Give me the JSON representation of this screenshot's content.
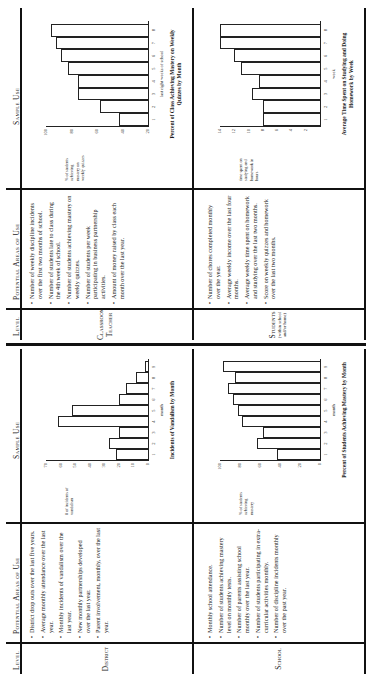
{
  "left_table": {
    "headers": {
      "level": "Level",
      "areas": "Potential Areas of Use",
      "sample": "Sample Use"
    },
    "rows": [
      {
        "level": "District",
        "areas": [
          "District drop outs over the last five years.",
          "Average monthly attendance over the last year.",
          "Monthly incidents of vandalism over the last year.",
          "New monthly partnerships developed over the last year.",
          "Parent involvement, monthly, over the last year."
        ]
      },
      {
        "level": "School",
        "areas": [
          "Monthly school attendance.",
          "Number of students achieving mastery level on monthly tests.",
          "Number of parents assisting school monthly over the last year.",
          "Number of students participating in extra-curricular activities monthly.",
          "Number of discipline incidents monthly over the past year."
        ]
      }
    ]
  },
  "right_table": {
    "headers": {
      "level": "Level",
      "areas": "Potential Areas of Use",
      "sample": "Sample Use"
    },
    "rows": [
      {
        "level": "Classroom Teacher",
        "areas": [
          "Number of weekly discipline incidents over the first two months of school.",
          "Number of students late to class during the 4th week of school.",
          "Number of students achieving mastery on weekly quizzes.",
          "Number of students per week participating in business partnership activities.",
          "Amount of money raised by class each month over the last year."
        ]
      },
      {
        "level": "Students",
        "level_note": "(within school and/or home)",
        "areas": [
          "Number of chores completed monthly over the year.",
          "Average weekly income over the last four months.",
          "Average weekly time spent on homework and studying over the last two months.",
          "Score on weekly quizzes and homework over the last two months."
        ]
      }
    ]
  },
  "chart_data": [
    {
      "type": "bar",
      "title": "Incidents of Vandalism by Month",
      "xlabel": "month",
      "ylabel": "# of incidents of vandalism",
      "categories": [
        "1",
        "2",
        "3",
        "4",
        "5",
        "6",
        "7",
        "8",
        "9"
      ],
      "values": [
        22,
        27,
        20,
        62,
        52,
        20,
        15,
        8,
        2
      ],
      "yticks": [
        "0",
        "10",
        "20",
        "30",
        "40",
        "50",
        "60",
        "70"
      ],
      "ylim": [
        0,
        70
      ]
    },
    {
      "type": "bar",
      "title": "Percent of Students Achieving Mastery by Month",
      "xlabel": "month",
      "ylabel": "% of students achieving mastery",
      "categories": [
        "1",
        "2",
        "3",
        "4",
        "5",
        "6",
        "7",
        "8",
        "9"
      ],
      "values": [
        43,
        63,
        57,
        78,
        82,
        87,
        92,
        85,
        97
      ],
      "yticks": [
        "0",
        "20",
        "40",
        "60",
        "80",
        "100"
      ],
      "ylim": [
        0,
        100
      ]
    },
    {
      "type": "bar",
      "title": "Percent of Class Achieving Mastery on Weekly Quizzes by Month",
      "xlabel": "last eight weeks of school",
      "ylabel": "% of students achieving mastery on weekly quizzes",
      "categories": [
        "1",
        "2",
        "3",
        "4",
        "5",
        "6",
        "7",
        "8"
      ],
      "values": [
        43,
        58,
        75,
        75,
        83,
        88,
        92,
        96
      ],
      "yticks": [
        "20",
        "40",
        "60",
        "80",
        "100"
      ],
      "ylim": [
        20,
        100
      ]
    },
    {
      "type": "bar",
      "title": "Average Time Spent on Studying and Doing Homework by Week",
      "xlabel": "week",
      "ylabel": "time spent on studying and homework in hours",
      "categories": [
        "1",
        "2",
        "3",
        "4",
        "5",
        "6",
        "7",
        "8"
      ],
      "values": [
        8,
        8,
        9.5,
        8.5,
        11,
        12,
        14,
        14
      ],
      "yticks": [
        "2",
        "4",
        "6",
        "8",
        "10",
        "12",
        "14"
      ],
      "ylim": [
        0,
        14
      ]
    }
  ]
}
